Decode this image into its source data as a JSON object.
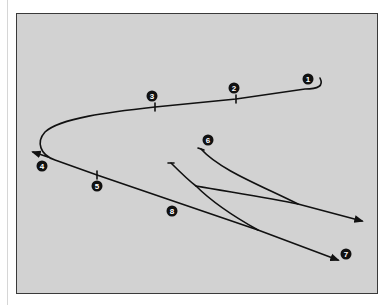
{
  "diagram": {
    "type": "route-path",
    "background_color": "#d2d2d2",
    "line_color": "#111111",
    "markers": [
      {
        "id": "1",
        "label": "1",
        "x": 308,
        "y": 79
      },
      {
        "id": "2",
        "label": "2",
        "x": 234,
        "y": 88
      },
      {
        "id": "3",
        "label": "3",
        "x": 152,
        "y": 96
      },
      {
        "id": "4",
        "label": "4",
        "x": 42,
        "y": 166
      },
      {
        "id": "5",
        "label": "5",
        "x": 97,
        "y": 186
      },
      {
        "id": "6",
        "label": "6",
        "x": 208,
        "y": 140
      },
      {
        "id": "7",
        "label": "7",
        "x": 346,
        "y": 254
      },
      {
        "id": "8",
        "label": "8",
        "x": 172,
        "y": 211
      }
    ]
  }
}
